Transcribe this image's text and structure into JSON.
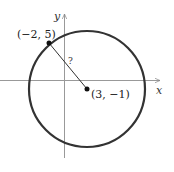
{
  "diagram": {
    "axes": {
      "x_label": "x",
      "y_label": "y"
    },
    "circle": {
      "stroke_color": "#333333"
    },
    "point_on_circle": {
      "label": "(−2, 5)"
    },
    "center": {
      "label": "(3, −1)"
    },
    "radius_label": "?"
  }
}
